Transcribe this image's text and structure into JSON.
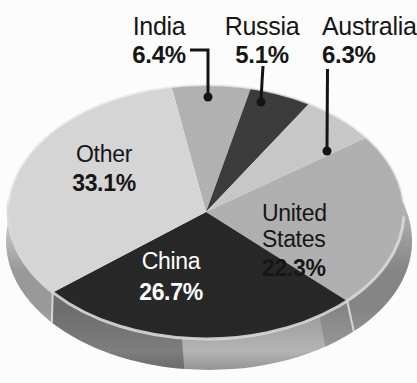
{
  "chart_data": {
    "type": "pie",
    "title": "",
    "style": "3d-extruded-grayscale-halftone",
    "legend_position": "none",
    "direction": "clockwise",
    "start_angle_deg": 100,
    "background": "#fcfcfc",
    "text_color": "#161616",
    "slices": [
      {
        "label": "India",
        "value": 6.4,
        "display": "6.4%",
        "color": "#b3b3b3",
        "label_placement": "callout-top",
        "label_color": "#161616"
      },
      {
        "label": "Russia",
        "value": 5.1,
        "display": "5.1%",
        "color": "#3c3c3c",
        "label_placement": "callout-top",
        "label_color": "#161616"
      },
      {
        "label": "Australia",
        "value": 6.3,
        "display": "6.3%",
        "color": "#c9c9c9",
        "label_placement": "callout-top",
        "label_color": "#161616"
      },
      {
        "label": "United States",
        "value": 22.3,
        "display": "22.3%",
        "color": "#b1b1b1",
        "label_placement": "on-slice",
        "label_color": "#161616"
      },
      {
        "label": "China",
        "value": 26.7,
        "display": "26.7%",
        "color": "#282828",
        "label_placement": "on-slice",
        "label_color": "#ffffff"
      },
      {
        "label": "Other",
        "value": 33.1,
        "display": "33.1%",
        "color": "#d7d7d7",
        "label_placement": "on-slice",
        "label_color": "#161616"
      }
    ],
    "rim": {
      "gradient": [
        "#d8d8d8",
        "#9a9a9a",
        "#b6b6b6",
        "#8e8e8e"
      ],
      "seam_color": "#e6e6e6"
    },
    "leader": {
      "line_color": "#141414",
      "dot_color": "#141414"
    }
  }
}
